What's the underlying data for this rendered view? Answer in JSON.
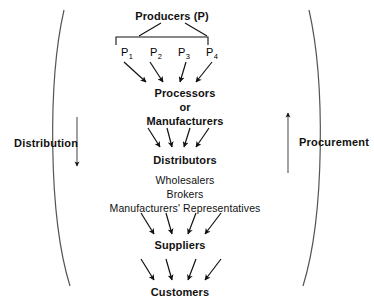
{
  "diagram": {
    "background_color": "#ffffff",
    "line_color": "#1a1a1a",
    "curve_color": "#555555",
    "levels": [
      {
        "id": "producers",
        "title": "Producers (P)",
        "subtitles": []
      },
      {
        "id": "producer-items",
        "title": "",
        "items": [
          {
            "base": "P",
            "sub": "1"
          },
          {
            "base": "P",
            "sub": "2"
          },
          {
            "base": "P",
            "sub": "3"
          },
          {
            "base": "P",
            "sub": "4"
          }
        ]
      },
      {
        "id": "processors",
        "title": "Processors",
        "subtitles": [
          "or",
          "Manufacturers"
        ]
      },
      {
        "id": "distributors",
        "title": "Distributors",
        "subtitles": [
          "Wholesalers",
          "Brokers",
          "Manufacturers' Representatives"
        ]
      },
      {
        "id": "suppliers",
        "title": "Suppliers",
        "subtitles": []
      },
      {
        "id": "customers",
        "title": "Customers",
        "subtitles": []
      }
    ],
    "side_labels": {
      "left": "Distribution",
      "right": "Procurement"
    },
    "flow_direction": {
      "left": "down",
      "right": "up"
    }
  }
}
